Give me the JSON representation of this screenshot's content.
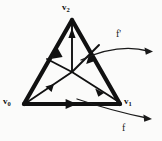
{
  "figure": {
    "type": "geometric-diagram",
    "background_color": "#fbfbfa",
    "ink_color": "#111111"
  },
  "vertices": [
    {
      "id": "v0",
      "label": "v",
      "subscript": "0",
      "x": 24,
      "y": 104,
      "label_x": 3,
      "label_y": 97
    },
    {
      "id": "v1",
      "label": "v",
      "subscript": "1",
      "x": 120,
      "y": 104,
      "label_x": 124,
      "label_y": 97
    },
    {
      "id": "v2",
      "label": "v",
      "subscript": "2",
      "x": 72,
      "y": 20,
      "label_x": 62,
      "label_y": 3
    }
  ],
  "barycenter": {
    "id": "b",
    "x": 72,
    "y": 72
  },
  "edges": [
    {
      "id": "edge-v0-v2",
      "from": "v0",
      "to": "v2",
      "arrow_direction": "up-right",
      "weight": "thick"
    },
    {
      "id": "edge-v1-v2",
      "from": "v1",
      "to": "v2",
      "arrow_direction": "up-left",
      "weight": "thick"
    },
    {
      "id": "edge-v0-v1",
      "from": "v0",
      "to": "v1",
      "arrow_direction": "right",
      "weight": "thick"
    }
  ],
  "interior_arrows": [
    {
      "id": "arrow-b-v2",
      "from": "b",
      "to": "v2",
      "direction": "up"
    },
    {
      "id": "arrow-v0-b",
      "from": "v0",
      "to": "b",
      "direction": "up-right"
    },
    {
      "id": "arrow-b-v1",
      "from": "b",
      "to": "v1",
      "direction": "down-right"
    }
  ],
  "map_arrows": [
    {
      "id": "arrow-f-prime",
      "label": "f'",
      "label_x": 116,
      "label_y": 29,
      "start": {
        "x": 81,
        "y": 59
      },
      "end": {
        "x": 152,
        "y": 51
      },
      "curvature": "arc-up",
      "style": "thin-curved"
    },
    {
      "id": "arrow-f",
      "label": "f",
      "label_x": 122,
      "label_y": 123,
      "start": {
        "x": 77,
        "y": 99
      },
      "end": {
        "x": 151,
        "y": 119
      },
      "curvature": "arc-down",
      "style": "thin-curved"
    }
  ]
}
